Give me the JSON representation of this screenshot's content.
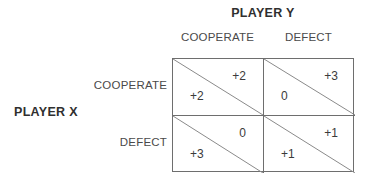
{
  "diagram": {
    "type": "payoff-matrix",
    "column_player": "PLAYER Y",
    "row_player": "PLAYER X",
    "column_headers": [
      "COOPERATE",
      "DEFECT"
    ],
    "row_headers": [
      "COOPERATE",
      "DEFECT"
    ],
    "colors": {
      "line": "#6e6e6e",
      "diagonal": "#8a8a8a",
      "text": "#3b3b3b",
      "heading": "#2f2f2f",
      "background": "#ffffff"
    },
    "cells": [
      {
        "row": "COOPERATE",
        "column": "COOPERATE",
        "upper_value": "+2",
        "lower_value": "+2"
      },
      {
        "row": "COOPERATE",
        "column": "DEFECT",
        "upper_value": "+3",
        "lower_value": "0"
      },
      {
        "row": "DEFECT",
        "column": "COOPERATE",
        "upper_value": "0",
        "lower_value": "+3"
      },
      {
        "row": "DEFECT",
        "column": "DEFECT",
        "upper_value": "+1",
        "lower_value": "+1"
      }
    ]
  }
}
